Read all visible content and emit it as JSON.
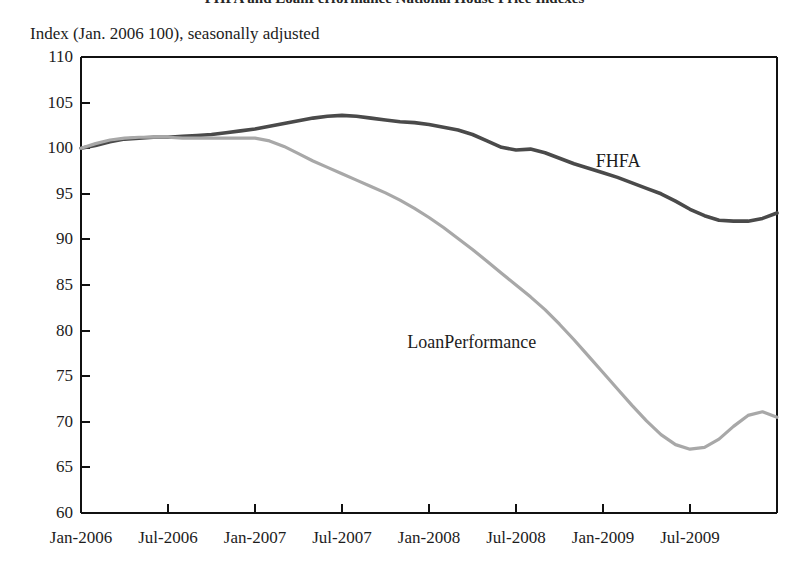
{
  "chart_data": {
    "type": "line",
    "title": "FHFA and LoanPerformance National House Price Indexes",
    "subtitle": "Index (Jan. 2006  100), seasonally adjusted",
    "xlabel": "",
    "ylabel": "",
    "ylim": [
      60,
      110
    ],
    "ytick_labels": [
      "110",
      "105",
      "100",
      "95",
      "90",
      "85",
      "80",
      "75",
      "70",
      "65",
      "60"
    ],
    "ytick_values": [
      110,
      105,
      100,
      95,
      90,
      85,
      80,
      75,
      70,
      65,
      60
    ],
    "xtick_labels": [
      "Jan-2006",
      "Jul-2006",
      "Jan-2007",
      "Jul-2007",
      "Jan-2008",
      "Jul-2008",
      "Jan-2009",
      "Jul-2009"
    ],
    "xtick_values": [
      0,
      6,
      12,
      18,
      24,
      30,
      36,
      42
    ],
    "xlim": [
      0,
      48
    ],
    "grid": false,
    "legend_position": "inline-annotations",
    "annotations": [
      {
        "text": "FHFA",
        "x": 35.5,
        "y": 98.6
      },
      {
        "text": "LoanPerformance",
        "x": 22.5,
        "y": 78.8
      }
    ],
    "series": [
      {
        "name": "FHFA",
        "color": "#4a4a4a",
        "x": [
          0,
          1,
          2,
          3,
          4,
          5,
          6,
          7,
          8,
          9,
          10,
          11,
          12,
          13,
          14,
          15,
          16,
          17,
          18,
          19,
          20,
          21,
          22,
          23,
          24,
          25,
          26,
          27,
          28,
          29,
          30,
          31,
          32,
          33,
          34,
          35,
          36,
          37,
          38,
          39,
          40,
          41,
          42,
          43,
          44,
          45,
          46,
          47,
          48
        ],
        "values": [
          100.0,
          100.3,
          100.7,
          101.0,
          101.1,
          101.2,
          101.2,
          101.3,
          101.4,
          101.5,
          101.7,
          101.9,
          102.1,
          102.4,
          102.7,
          103.0,
          103.3,
          103.5,
          103.6,
          103.5,
          103.3,
          103.1,
          102.9,
          102.8,
          102.6,
          102.3,
          102.0,
          101.5,
          100.8,
          100.1,
          99.8,
          99.9,
          99.5,
          98.9,
          98.3,
          97.8,
          97.3,
          96.8,
          96.2,
          95.6,
          95.0,
          94.2,
          93.3,
          92.6,
          92.1,
          92.0,
          92.0,
          92.3,
          92.9
        ]
      },
      {
        "name": "LoanPerformance",
        "color": "#a8a8a8",
        "x": [
          0,
          1,
          2,
          3,
          4,
          5,
          6,
          7,
          8,
          9,
          10,
          11,
          12,
          13,
          14,
          15,
          16,
          17,
          18,
          19,
          20,
          21,
          22,
          23,
          24,
          25,
          26,
          27,
          28,
          29,
          30,
          31,
          32,
          33,
          34,
          35,
          36,
          37,
          38,
          39,
          40,
          41,
          42,
          43,
          44,
          45,
          46,
          47,
          48
        ],
        "values": [
          100.0,
          100.5,
          100.9,
          101.1,
          101.2,
          101.2,
          101.2,
          101.1,
          101.1,
          101.1,
          101.1,
          101.1,
          101.1,
          100.8,
          100.2,
          99.4,
          98.6,
          97.9,
          97.2,
          96.5,
          95.8,
          95.1,
          94.3,
          93.4,
          92.4,
          91.3,
          90.1,
          88.9,
          87.6,
          86.3,
          85.0,
          83.7,
          82.3,
          80.7,
          79.0,
          77.2,
          75.4,
          73.6,
          71.8,
          70.1,
          68.6,
          67.5,
          67.0,
          67.2,
          68.1,
          69.5,
          70.7,
          71.1,
          70.5
        ]
      }
    ],
    "fhfa_tail_detail": {
      "note": "FHFA flattens near 92 from late 2008 with a local bump to about 93 in early 2009, a dip to about 91.7 mid-2009, ending near 92.7"
    },
    "loanperformance_tail_detail": {
      "note": "LoanPerformance troughs near 67 in spring 2009, recovers to about 71.1 in late 2009, ending near 70.5"
    }
  }
}
